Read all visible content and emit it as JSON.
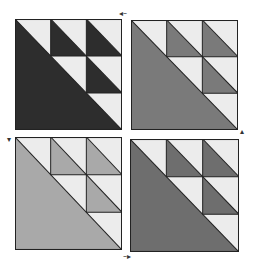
{
  "figure": {
    "colors": {
      "light": "#ececec",
      "dark_top_left": "#2d2d2d",
      "medium_top_right": "#7a7a7a",
      "light_gray_bottom_left": "#a9a9a9",
      "medium_bottom_right": "#6e6e6e",
      "outline": "#222222"
    },
    "blocks": [
      {
        "position": "top-left",
        "fill": "#2d2d2d"
      },
      {
        "position": "top-right",
        "fill": "#7a7a7a"
      },
      {
        "position": "bottom-left",
        "fill": "#a9a9a9"
      },
      {
        "position": "bottom-right",
        "fill": "#6e6e6e"
      }
    ],
    "arrows": [
      {
        "position": "top-center",
        "glyph": "◂–",
        "direction": "left"
      },
      {
        "position": "left-middle",
        "glyph": "▾",
        "direction": "down"
      },
      {
        "position": "right-middle",
        "glyph": "▴",
        "direction": "up"
      },
      {
        "position": "bottom-center",
        "glyph": "–▸",
        "direction": "right"
      }
    ]
  }
}
